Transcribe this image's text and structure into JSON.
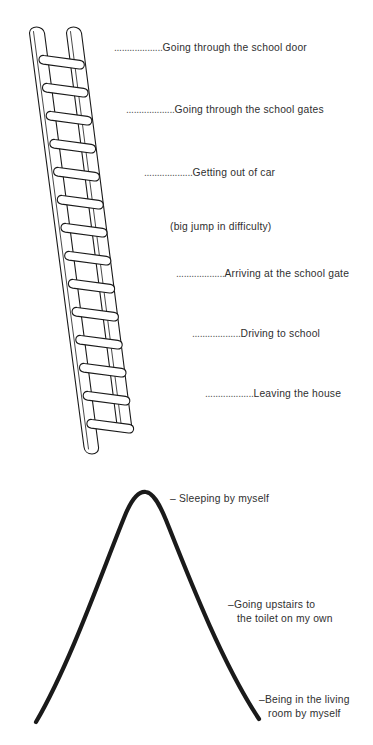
{
  "figure": {
    "background_color": "#ffffff",
    "ink_color": "#1a1a1a",
    "text_color": "#2f2f2f"
  },
  "ladder": {
    "name": "anxiety-ladder-diagram",
    "rung_count": 14,
    "steps": [
      {
        "leader": "...................",
        "text": "Going through the school door",
        "x": 114,
        "y": 46
      },
      {
        "leader": "...................",
        "text": "Going through the school gates",
        "x": 126,
        "y": 108
      },
      {
        "leader": "...................",
        "text": "Getting out of car",
        "x": 144,
        "y": 171
      },
      {
        "leader": "",
        "text": "(big jump in difficulty)",
        "x": 170,
        "y": 225
      },
      {
        "leader": "...................",
        "text": "Arriving at the school gate",
        "x": 176,
        "y": 272
      },
      {
        "leader": "...................",
        "text": "Driving to school",
        "x": 192,
        "y": 332
      },
      {
        "leader": "...................",
        "text": "Leaving the house",
        "x": 205,
        "y": 392
      }
    ]
  },
  "curve": {
    "name": "anxiety-bell-curve-diagram",
    "labels": [
      {
        "dash": "–",
        "line1": "Sleeping by myself",
        "line2": "",
        "x": 170,
        "y": 490
      },
      {
        "dash": "–",
        "line1": "Going upstairs to",
        "line2": "the toilet on my own",
        "x": 228,
        "y": 596
      },
      {
        "dash": "–",
        "line1": "Being in the living",
        "line2": "room by myself",
        "x": 259,
        "y": 691
      }
    ]
  }
}
